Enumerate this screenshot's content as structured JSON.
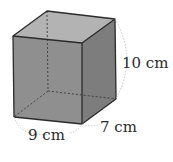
{
  "figure": {
    "type": "rectangular prism",
    "labels": {
      "height": "10 cm",
      "width": "9 cm",
      "depth": "7 cm"
    },
    "colors": {
      "front_face": "#8f8f8f",
      "top_face": "#b3b3b3",
      "side_face": "#7d7d7d",
      "edge": "#2b2b2b",
      "dimension_arc": "#bdbdbd"
    }
  }
}
